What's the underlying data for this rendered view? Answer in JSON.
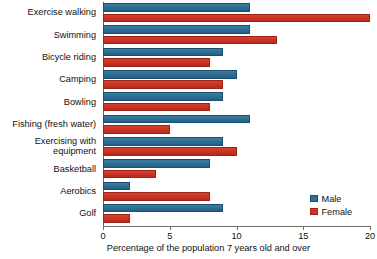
{
  "chart_data": {
    "type": "bar",
    "orientation": "horizontal",
    "title": "",
    "xlabel": "Percentage of the population 7 years old and over",
    "ylabel": "",
    "xlim": [
      0,
      20
    ],
    "xticks": [
      0,
      5,
      10,
      15,
      20
    ],
    "xtick_labels": [
      "0",
      "5",
      "10",
      "15",
      "20"
    ],
    "grid": false,
    "legend_position": "bottom-right",
    "categories": [
      "Exercise walking",
      "Swimming",
      "Bicycle riding",
      "Camping",
      "Bowling",
      "Fishing (fresh water)",
      "Exercising with\nequipment",
      "Basketball",
      "Aerobics",
      "Golf"
    ],
    "series": [
      {
        "name": "Male",
        "color": "#2e7096",
        "values": [
          11,
          11,
          9,
          10,
          9,
          11,
          9,
          8,
          2,
          9
        ]
      },
      {
        "name": "Female",
        "color": "#cc3526",
        "values": [
          20,
          13,
          8,
          9,
          8,
          5,
          10,
          4,
          8,
          2
        ]
      }
    ]
  },
  "legend": {
    "items": [
      {
        "label": "Male",
        "color": "#2e7096"
      },
      {
        "label": "Female",
        "color": "#cc3526"
      }
    ]
  },
  "axis": {
    "x_label": "Percentage of the population 7 years old and over"
  }
}
